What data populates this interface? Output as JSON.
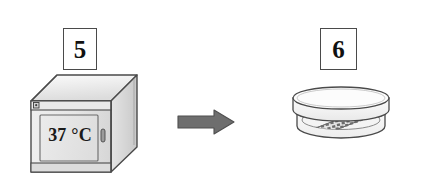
{
  "figure": {
    "background_color": "#ffffff",
    "width": 428,
    "height": 190,
    "caption": ""
  },
  "steps": [
    {
      "number": "5",
      "subject": "incubator",
      "display_text": "37 °C",
      "temperature_value": "37",
      "temperature_unit": "°C"
    },
    {
      "number": "6",
      "subject": "petri-dish",
      "display_text": ""
    }
  ],
  "arrow": {
    "direction": "right",
    "color": "#6e6e6e",
    "outline_color": "#4a4a4a",
    "label": ""
  },
  "colors": {
    "outline": "#4a4a4a",
    "ink": "#111111",
    "panel_light": "#efefef",
    "panel_mid": "#e2e2e2",
    "panel_dark": "#cdcdcd",
    "arrow_gray": "#6e6e6e",
    "colony_gray": "#8a8a8a"
  },
  "incubator": {
    "door_label": "37 °C",
    "latch_name": "door-handle",
    "badge_name": "control-badge"
  },
  "petri_dish": {
    "lid_name": "dish-lid",
    "base_name": "dish-base",
    "culture_name": "streaked-colonies",
    "colony_rows": 3,
    "colony_columns": 12
  }
}
